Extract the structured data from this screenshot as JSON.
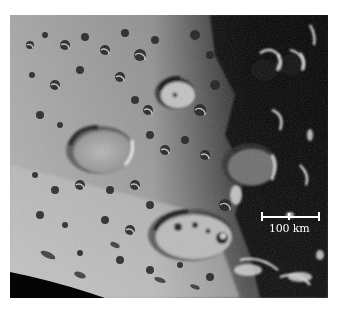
{
  "image": {
    "subject": "Cratered lunar surface near the terminator with limb of the Moon at lower left",
    "colors": {
      "background": "#ffffff",
      "highland": "#9a9a9a",
      "highland_light": "#c8c8c8",
      "shadow": "#0a0a0a",
      "space": "#050505"
    }
  },
  "scale_bar": {
    "label": "100 km",
    "color": "#ffffff"
  }
}
